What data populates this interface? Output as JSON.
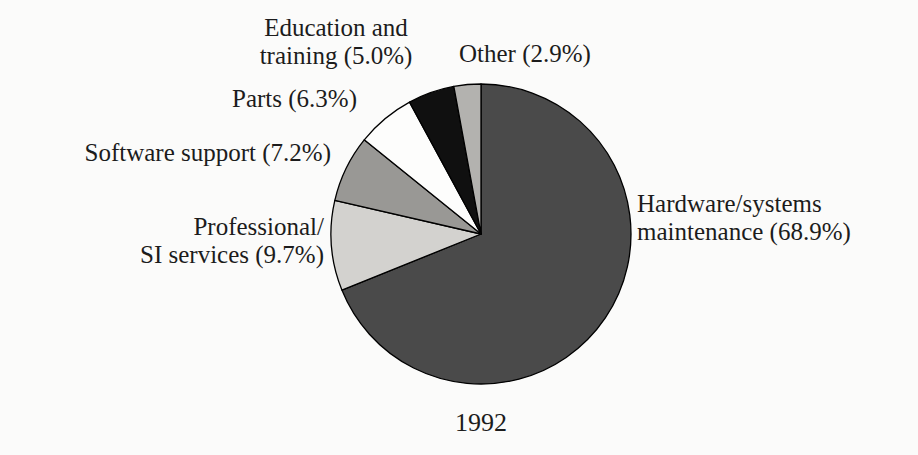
{
  "chart_data": {
    "type": "pie",
    "title": "1992",
    "start_angle_deg": 0,
    "direction": "clockwise",
    "stroke_color": "#000000",
    "background_color": "#fbfbfa",
    "text_color": "#1c1c1c",
    "legend_position": "none",
    "labels_placement": "outside-callout-free",
    "slices": [
      {
        "id": "hardware",
        "name": "Hardware/systems maintenance",
        "value": 68.9,
        "color": "#4a4a4a",
        "label_lines": [
          "Hardware/systems",
          "maintenance (68.9%)"
        ]
      },
      {
        "id": "professional",
        "name": "Professional/SI services",
        "value": 9.7,
        "color": "#d3d2cf",
        "label_lines": [
          "Professional/",
          "SI services (9.7%)"
        ]
      },
      {
        "id": "software",
        "name": "Software support",
        "value": 7.2,
        "color": "#999895",
        "label_lines": [
          "Software support (7.2%)"
        ]
      },
      {
        "id": "parts",
        "name": "Parts",
        "value": 6.3,
        "color": "#fdfdfc",
        "label_lines": [
          "Parts (6.3%)"
        ]
      },
      {
        "id": "education",
        "name": "Education and training",
        "value": 5.0,
        "color": "#101010",
        "label_lines": [
          "Education and",
          "training (5.0%)"
        ]
      },
      {
        "id": "other",
        "name": "Other",
        "value": 2.9,
        "color": "#b3b2af",
        "label_lines": [
          "Other (2.9%)"
        ]
      }
    ]
  }
}
